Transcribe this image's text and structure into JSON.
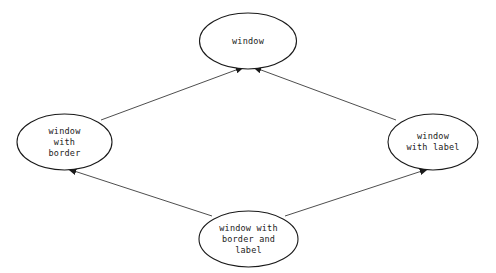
{
  "diagram": {
    "type": "directed-graph",
    "background_color": "#ffffff",
    "node_fill": "#ffffff",
    "node_stroke": "#1a1a1a",
    "edge_color": "#3a3a3a",
    "text_color": "#222222",
    "nodes": [
      {
        "id": "window",
        "label": "window",
        "lines": [
          "window"
        ],
        "cx": 248,
        "cy": 41,
        "rx": 48.5,
        "ry": 28
      },
      {
        "id": "window-with-border",
        "label": "window with border",
        "lines": [
          "window",
          "with",
          "border"
        ],
        "cx": 64.5,
        "cy": 142,
        "rx": 47.5,
        "ry": 28
      },
      {
        "id": "window-with-label",
        "label": "window with label",
        "lines": [
          "window",
          "with label"
        ],
        "cx": 433,
        "cy": 142,
        "rx": 45,
        "ry": 28
      },
      {
        "id": "window-with-border-and-label",
        "label": "window with border and label",
        "lines": [
          "window with",
          "border and",
          "label"
        ],
        "cx": 248.5,
        "cy": 239,
        "rx": 49.5,
        "ry": 28
      }
    ],
    "edges": [
      {
        "id": "edge-border-to-window",
        "from": "window-with-border",
        "to": "window",
        "x1": 101,
        "y1": 120,
        "x2": 244,
        "y2": 67,
        "arrow": "end"
      },
      {
        "id": "edge-label-to-window",
        "from": "window-with-label",
        "to": "window",
        "x1": 396,
        "y1": 120,
        "x2": 253,
        "y2": 67,
        "arrow": "end"
      },
      {
        "id": "edge-bordlabel-to-border",
        "from": "window-with-border-and-label",
        "to": "window-with-border",
        "x1": 212,
        "y1": 216,
        "x2": 68,
        "y2": 169,
        "arrow": "end"
      },
      {
        "id": "edge-bordlabel-to-label",
        "from": "window-with-border-and-label",
        "to": "window-with-label",
        "x1": 285,
        "y1": 216,
        "x2": 428,
        "y2": 169,
        "arrow": "end"
      }
    ]
  }
}
